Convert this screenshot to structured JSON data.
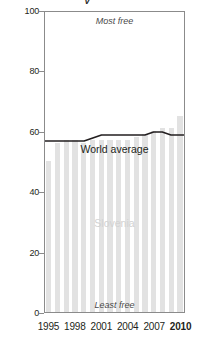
{
  "chart_data": {
    "type": "bar",
    "title": "",
    "xlabel": "",
    "ylabel": "",
    "ylim": [
      0,
      100
    ],
    "xlim": [
      1995,
      2010
    ],
    "grid": false,
    "legend_position": "inline-annotation",
    "categories": [
      1995,
      1996,
      1997,
      1998,
      1999,
      2000,
      2001,
      2002,
      2003,
      2004,
      2005,
      2006,
      2007,
      2008,
      2009,
      2010
    ],
    "series": [
      {
        "name": "Slovenia",
        "type": "bar",
        "color": "#e2e2e2",
        "values": [
          50,
          56,
          57,
          57,
          56,
          57,
          57,
          57,
          57,
          57,
          58,
          59,
          60,
          61,
          61,
          65
        ]
      },
      {
        "name": "World average",
        "type": "line",
        "color": "#231f20",
        "values": [
          57,
          57,
          57,
          57,
          57,
          58,
          59,
          59,
          59,
          59,
          59,
          59,
          60,
          60,
          59,
          59
        ]
      }
    ],
    "annotations": [
      {
        "text": "Most free",
        "position": "top-center"
      },
      {
        "text": "Least free",
        "position": "bottom-center"
      },
      {
        "text": "World average",
        "position": "line-label"
      },
      {
        "text": "Slovenia",
        "position": "bars-label"
      }
    ],
    "yticks": [
      {
        "value": 100,
        "label": "100"
      },
      {
        "value": 80,
        "label": "80"
      },
      {
        "value": 60,
        "label": "60"
      },
      {
        "value": 40,
        "label": "40"
      },
      {
        "value": 20,
        "label": "20"
      },
      {
        "value": 0,
        "label": "0"
      }
    ],
    "xticks": [
      {
        "value": 1995,
        "label": "1995",
        "bold": false
      },
      {
        "value": 1998,
        "label": "1998",
        "bold": false
      },
      {
        "value": 2001,
        "label": "2001",
        "bold": false
      },
      {
        "value": 2004,
        "label": "2004",
        "bold": false
      },
      {
        "value": 2007,
        "label": "2007",
        "bold": false
      },
      {
        "value": 2010,
        "label": "2010",
        "bold": true
      }
    ]
  },
  "colors": {
    "bar": "#e2e2e2",
    "line": "#231f20",
    "frame": "#8b8b8b",
    "annotation": "#4a4a4a",
    "bar_label": "#d2d2d2"
  }
}
